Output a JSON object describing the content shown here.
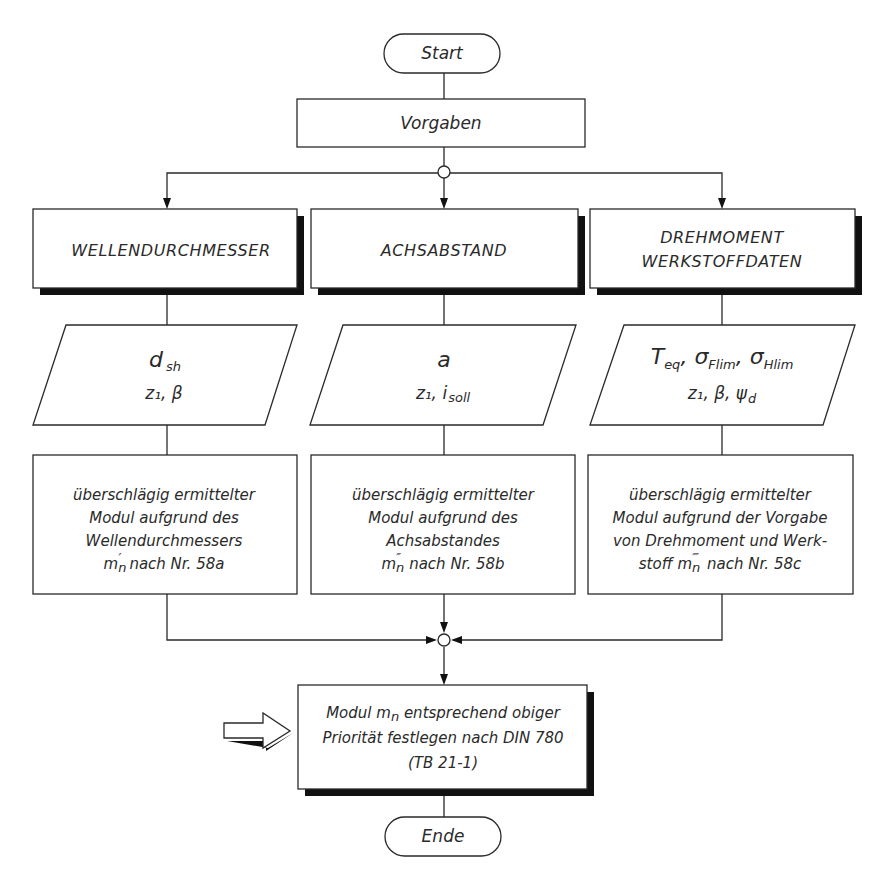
{
  "diagram": {
    "type": "flowchart",
    "start": {
      "label": "Start"
    },
    "input": {
      "label": "Vorgaben"
    },
    "branches": [
      {
        "id": "wellendurchmesser",
        "heading": [
          "WELLENDURCHMESSER"
        ],
        "given": {
          "line1": {
            "main": "d",
            "sub": "sh"
          },
          "line2": "z₁, β"
        },
        "process": {
          "lines": [
            "überschlägig ermittelter",
            "Modul aufgrund des",
            "Wellendurchmessers"
          ],
          "last": {
            "symbol": "m",
            "sub": "n",
            "mark": "′",
            "text": "nach Nr. 58a"
          }
        }
      },
      {
        "id": "achsabstand",
        "heading": [
          "ACHSABSTAND"
        ],
        "given": {
          "line1": {
            "main": "a",
            "sub": ""
          },
          "line2_main": "z₁, i",
          "line2_sub": "soll"
        },
        "process": {
          "lines": [
            "überschlägig ermittelter",
            "Modul aufgrund des",
            "Achsabstandes"
          ],
          "last": {
            "symbol": "m",
            "sub": "n",
            "mark": "″",
            "text": "nach Nr. 58b"
          }
        }
      },
      {
        "id": "drehmoment-werkstoffdaten",
        "heading": [
          "DREHMOMENT",
          "WERKSTOFFDATEN"
        ],
        "given": {
          "line1_parts": [
            {
              "main": "T",
              "sub": "eq"
            },
            {
              "main": "σ",
              "sub": "Flim"
            },
            {
              "main": "σ",
              "sub": "Hlim"
            }
          ],
          "line2_main": "z₁, β, ψ",
          "line2_sub": "d"
        },
        "process": {
          "lines": [
            "überschlägig ermittelter",
            "Modul aufgrund der Vorgabe",
            "von Drehmoment und Werk-"
          ],
          "last": {
            "prefix": "stoff",
            "symbol": "m",
            "sub": "n",
            "mark": "‴",
            "text": "nach Nr. 58c"
          }
        }
      }
    ],
    "result": {
      "line1_pre": "Modul m",
      "line1_sub": "n",
      "line1_post": " entsprechend obiger",
      "line2": "Priorität festlegen nach DIN 780",
      "line3": "(TB 21-1)"
    },
    "end": {
      "label": "Ende"
    },
    "edges": [
      [
        "start",
        "vorgaben"
      ],
      [
        "vorgaben",
        "split-junction"
      ],
      [
        "split-junction",
        "wellendurchmesser"
      ],
      [
        "split-junction",
        "achsabstand"
      ],
      [
        "split-junction",
        "drehmoment-werkstoffdaten"
      ],
      [
        "wellendurchmesser",
        "given-1"
      ],
      [
        "achsabstand",
        "given-2"
      ],
      [
        "drehmoment-werkstoffdaten",
        "given-3"
      ],
      [
        "given-1",
        "process-1"
      ],
      [
        "given-2",
        "process-2"
      ],
      [
        "given-3",
        "process-3"
      ],
      [
        "process-1",
        "merge-junction"
      ],
      [
        "process-2",
        "merge-junction"
      ],
      [
        "process-3",
        "merge-junction"
      ],
      [
        "merge-junction",
        "result"
      ],
      [
        "result",
        "ende"
      ]
    ],
    "highlight_marker": "block-arrow-right"
  }
}
